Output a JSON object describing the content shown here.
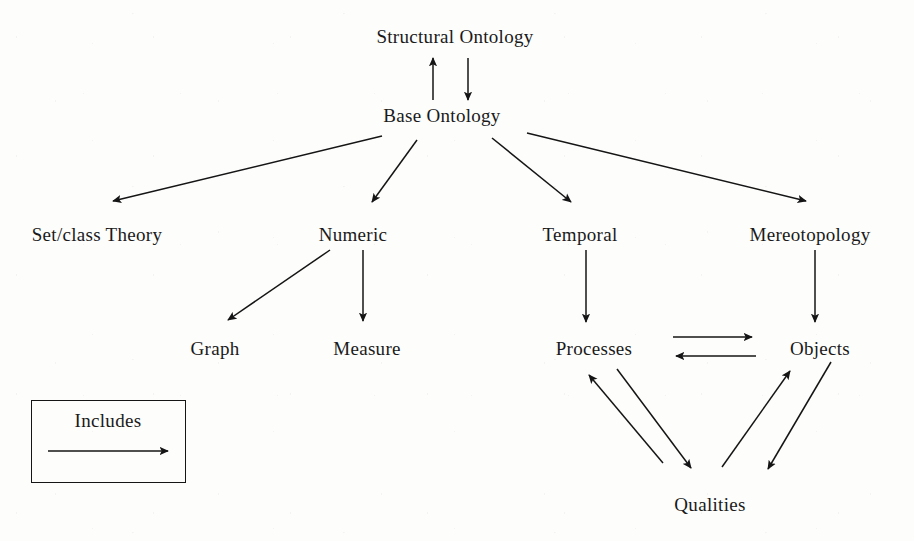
{
  "diagram": {
    "background_color": "#fdfdfc",
    "ink_color": "#151515",
    "nodes": [
      {
        "id": "structural_ontology",
        "label": "Structural Ontology",
        "x": 455,
        "y": 27,
        "level": 1
      },
      {
        "id": "base_ontology",
        "label": "Base Ontology",
        "x": 442,
        "y": 106,
        "level": 2
      },
      {
        "id": "set_class_theory",
        "label": "Set/class Theory",
        "x": 97,
        "y": 225,
        "level": 3
      },
      {
        "id": "numeric",
        "label": "Numeric",
        "x": 353,
        "y": 225,
        "level": 3
      },
      {
        "id": "temporal",
        "label": "Temporal",
        "x": 580,
        "y": 225,
        "level": 3
      },
      {
        "id": "mereotopology",
        "label": "Mereotopology",
        "x": 810,
        "y": 225,
        "level": 3
      },
      {
        "id": "graph",
        "label": "Graph",
        "x": 215,
        "y": 339,
        "level": 4
      },
      {
        "id": "measure",
        "label": "Measure",
        "x": 367,
        "y": 339,
        "level": 4
      },
      {
        "id": "processes",
        "label": "Processes",
        "x": 594,
        "y": 339,
        "level": 4
      },
      {
        "id": "objects",
        "label": "Objects",
        "x": 820,
        "y": 339,
        "level": 4
      },
      {
        "id": "qualities",
        "label": "Qualities",
        "x": 710,
        "y": 495,
        "level": 5
      }
    ],
    "edges": [
      {
        "from": "base_ontology",
        "to": "structural_ontology",
        "relation": "Includes",
        "direction": "up",
        "x1": 433,
        "y1": 100,
        "x2": 433,
        "y2": 58
      },
      {
        "from": "structural_ontology",
        "to": "base_ontology",
        "relation": "Includes",
        "direction": "down",
        "x1": 468,
        "y1": 58,
        "x2": 468,
        "y2": 100
      },
      {
        "from": "base_ontology",
        "to": "set_class_theory",
        "relation": "Includes",
        "x1": 382,
        "y1": 136,
        "x2": 113,
        "y2": 201
      },
      {
        "from": "base_ontology",
        "to": "numeric",
        "relation": "Includes",
        "x1": 417,
        "y1": 140,
        "x2": 372,
        "y2": 202
      },
      {
        "from": "base_ontology",
        "to": "temporal",
        "relation": "Includes",
        "x1": 492,
        "y1": 138,
        "x2": 571,
        "y2": 202
      },
      {
        "from": "base_ontology",
        "to": "mereotopology",
        "relation": "Includes",
        "x1": 527,
        "y1": 133,
        "x2": 806,
        "y2": 201
      },
      {
        "from": "numeric",
        "to": "graph",
        "relation": "Includes",
        "x1": 330,
        "y1": 250,
        "x2": 228,
        "y2": 320
      },
      {
        "from": "numeric",
        "to": "measure",
        "relation": "Includes",
        "x1": 363,
        "y1": 250,
        "x2": 363,
        "y2": 321
      },
      {
        "from": "temporal",
        "to": "processes",
        "relation": "Includes",
        "x1": 586,
        "y1": 250,
        "x2": 586,
        "y2": 322
      },
      {
        "from": "mereotopology",
        "to": "objects",
        "relation": "Includes",
        "x1": 815,
        "y1": 250,
        "x2": 815,
        "y2": 322
      },
      {
        "from": "processes",
        "to": "objects",
        "relation": "Includes",
        "direction": "right",
        "x1": 673,
        "y1": 337,
        "x2": 752,
        "y2": 337
      },
      {
        "from": "objects",
        "to": "processes",
        "relation": "Includes",
        "direction": "left",
        "x1": 756,
        "y1": 356,
        "x2": 676,
        "y2": 356
      },
      {
        "from": "qualities",
        "to": "processes",
        "relation": "Includes",
        "x1": 663,
        "y1": 463,
        "x2": 589,
        "y2": 375
      },
      {
        "from": "processes",
        "to": "qualities",
        "relation": "Includes",
        "x1": 617,
        "y1": 369,
        "x2": 691,
        "y2": 468
      },
      {
        "from": "qualities",
        "to": "objects",
        "relation": "Includes",
        "x1": 722,
        "y1": 467,
        "x2": 790,
        "y2": 371
      },
      {
        "from": "objects",
        "to": "qualities",
        "relation": "Includes",
        "x1": 831,
        "y1": 362,
        "x2": 768,
        "y2": 469
      }
    ],
    "legend": {
      "label": "Includes",
      "box": {
        "x": 31,
        "y": 400,
        "width": 155,
        "height": 83
      },
      "label_x": 108,
      "label_y": 411,
      "arrow": {
        "x1": 48,
        "y1": 451,
        "x2": 168,
        "y2": 451,
        "direction": "right"
      }
    }
  }
}
